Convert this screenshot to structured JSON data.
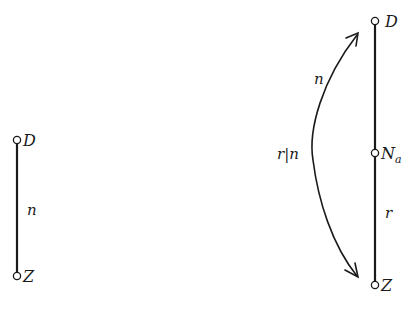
{
  "left_diagram": {
    "top_node": {
      "label": "D"
    },
    "bottom_node": {
      "label": "Z"
    },
    "edge_label": "n"
  },
  "right_diagram": {
    "top_node": {
      "label": "D"
    },
    "middle_node": {
      "label": "N",
      "subscript": "a"
    },
    "bottom_node": {
      "label": "Z"
    },
    "lower_edge_label": "r",
    "arc_upper_label": "n",
    "arc_middle_label": "r|n"
  },
  "colors": {
    "stroke": "#1a1a1a",
    "background": "#ffffff"
  }
}
